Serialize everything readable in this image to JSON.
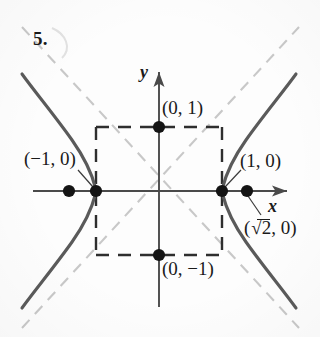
{
  "figure": {
    "number_label": "5.",
    "axes": {
      "x_label": "x",
      "y_label": "y",
      "origin_px": [
        159,
        191
      ],
      "unit_px": 63
    },
    "curve": {
      "type": "hyperbola",
      "equation": "x^2 - y^2 = 1",
      "a": 1,
      "b": 1,
      "c": 1.4142,
      "asymptotes": [
        "y = x",
        "y = -x"
      ],
      "color": "#555555",
      "asymptote_color": "#c9c9c9"
    },
    "box": {
      "description": "dashed fundamental rectangle",
      "x_range": [
        -1,
        1
      ],
      "y_range": [
        -1,
        1
      ],
      "color": "#2b2b2b"
    },
    "points": [
      {
        "name": "vertex-left",
        "label": "(−1, 0)",
        "x": -1,
        "y": 0,
        "labeled": true
      },
      {
        "name": "vertex-right",
        "label": "(1, 0)",
        "x": 1,
        "y": 0,
        "labeled": true
      },
      {
        "name": "co-vertex-top",
        "label": "(0, 1)",
        "x": 0,
        "y": 1,
        "labeled": true
      },
      {
        "name": "co-vertex-bottom",
        "label": "(0, −1)",
        "x": 0,
        "y": -1,
        "labeled": true
      },
      {
        "name": "focus-right",
        "label": "(√2, 0)",
        "x": 1.4142,
        "y": 0,
        "labeled": true
      },
      {
        "name": "focus-left",
        "label": "",
        "x": -1.4142,
        "y": 0,
        "labeled": false
      }
    ],
    "point_labels": {
      "vertex_left": "(−1, 0)",
      "vertex_right": "(1, 0)",
      "covertex_top": "(0, 1)",
      "covertex_bottom": "(0, −1)",
      "focus_right_prefix": "(",
      "focus_right_radicand": "2",
      "focus_right_suffix": ", 0)"
    }
  }
}
